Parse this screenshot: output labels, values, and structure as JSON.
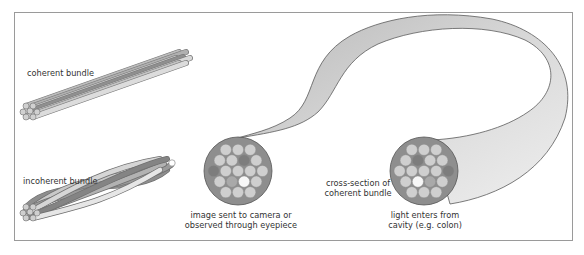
{
  "labels": {
    "coherent_bundle": "coherent bundle",
    "incoherent_bundle": "incoherent bundle",
    "cross_section": [
      "cross-section of",
      "coherent bundle"
    ],
    "camera_end": [
      "image sent to camera or",
      "observed through eyepiece"
    ],
    "cavity_end": [
      "light enters from",
      "cavity (e.g. colon)"
    ]
  },
  "fiber_shades": {
    "light": "#cfcfcf",
    "mid": "#a9a9a9",
    "dark": "#7d7d7d",
    "white": "#f7f7f7",
    "cladding": "#8e8e8e",
    "tube": "#c8c8c8"
  },
  "cross_sections": {
    "camera_end": {
      "rows": [
        [
          "light",
          "light",
          "light"
        ],
        [
          "light",
          "light",
          "dark",
          "light"
        ],
        [
          "dark",
          "light",
          "light",
          "light",
          "light"
        ],
        [
          "light",
          "mid",
          "white",
          "light"
        ],
        [
          "light",
          "light",
          "light"
        ]
      ]
    },
    "cavity_end": {
      "rows": [
        [
          "light",
          "light",
          "light"
        ],
        [
          "light",
          "dark",
          "light",
          "light"
        ],
        [
          "light",
          "light",
          "light",
          "light",
          "dark"
        ],
        [
          "light",
          "white",
          "mid",
          "light"
        ],
        [
          "light",
          "light",
          "light"
        ]
      ]
    }
  }
}
